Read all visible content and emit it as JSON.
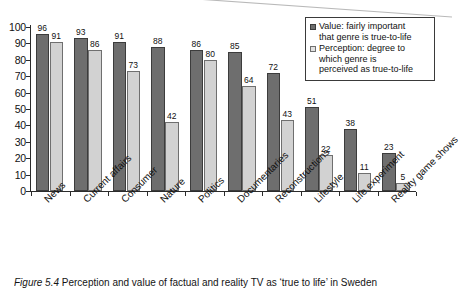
{
  "figure": {
    "caption_number": "Figure 5.4",
    "caption_text": "Perception and value of factual and reality TV as ‘true to life’ in Sweden"
  },
  "legend": {
    "position": "top-right",
    "entries": [
      {
        "swatch": "dark-gray-square-icon",
        "label_line1": "Value: fairly important",
        "label_line2": "that genre is true-to-life",
        "color": "#6e6e6e"
      },
      {
        "swatch": "light-gray-square-icon",
        "label_line1": "Perception: degree to",
        "label_line2": "which genre is",
        "label_line3": "perceived as true-to-life",
        "color": "#d2d2d2"
      }
    ]
  },
  "chart_data": {
    "type": "bar",
    "title": "",
    "subtitle": "",
    "xlabel": "",
    "ylabel": "",
    "ylim": [
      0,
      100
    ],
    "ytick_step": 10,
    "yticks": [
      100,
      90,
      80,
      70,
      60,
      50,
      40,
      30,
      20,
      10,
      0
    ],
    "grid": false,
    "legend_position": "top-right",
    "categories": [
      "News",
      "Current affairs",
      "Consumer",
      "Nature",
      "Politics",
      "Documentaries",
      "Reconstructions",
      "Lifestyle",
      "Life experiment",
      "Reality game shows"
    ],
    "series": [
      {
        "name": "Value: fairly important that genre is true-to-life",
        "color": "#6e6e6e",
        "values": [
          96,
          93,
          91,
          88,
          86,
          85,
          72,
          51,
          38,
          23
        ]
      },
      {
        "name": "Perception: degree to which genre is perceived as true-to-life",
        "color": "#d2d2d2",
        "values": [
          91,
          86,
          73,
          42,
          80,
          64,
          43,
          22,
          11,
          5
        ]
      }
    ]
  }
}
